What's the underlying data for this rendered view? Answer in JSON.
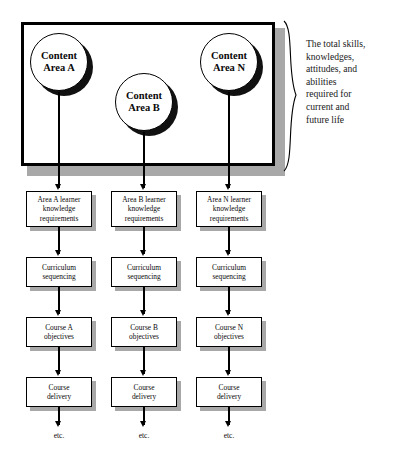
{
  "diagram": {
    "top_group": {
      "annotation_lines": [
        "The total  skills,",
        "knowledges,",
        "attitudes, and",
        "abilities",
        "required for",
        "current and",
        "future life"
      ],
      "circles": [
        {
          "line1": "Content",
          "line2": "Area A"
        },
        {
          "line1": "Content",
          "line2": "Area B"
        },
        {
          "line1": "Content",
          "line2": "Area N"
        }
      ]
    },
    "columns": [
      {
        "id": "column-a",
        "nodes": [
          {
            "lines": [
              "Area A learner",
              "knowledge",
              "requirements"
            ]
          },
          {
            "lines": [
              "Curriculum",
              "sequencing"
            ]
          },
          {
            "lines": [
              "Course A",
              "objectives"
            ]
          },
          {
            "lines": [
              "Course",
              "delivery"
            ]
          }
        ],
        "terminal": "etc."
      },
      {
        "id": "column-b",
        "nodes": [
          {
            "lines": [
              "Area B learner",
              "knowledge",
              "requirements"
            ]
          },
          {
            "lines": [
              "Curriculum",
              "sequencing"
            ]
          },
          {
            "lines": [
              "Course B",
              "objectives"
            ]
          },
          {
            "lines": [
              "Course",
              "delivery"
            ]
          }
        ],
        "terminal": "etc."
      },
      {
        "id": "column-n",
        "nodes": [
          {
            "lines": [
              "Area N learner",
              "knowledge",
              "requirements"
            ]
          },
          {
            "lines": [
              "Curriculum",
              "sequencing"
            ]
          },
          {
            "lines": [
              "Course N",
              "objectives"
            ]
          },
          {
            "lines": [
              "Course",
              "delivery"
            ]
          }
        ],
        "terminal": "etc."
      }
    ],
    "colors": {
      "outline": "#000000",
      "shadow": "#a8a8a8",
      "circle_shadow": "#111111",
      "background": "#ffffff"
    }
  }
}
